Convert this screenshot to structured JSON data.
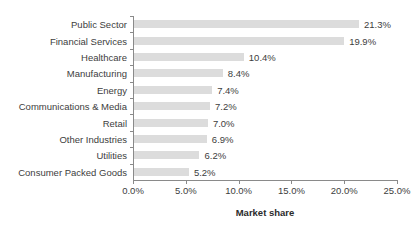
{
  "chart_data": {
    "type": "bar",
    "orientation": "horizontal",
    "title": "",
    "xlabel": "Market share",
    "ylabel": "",
    "xlim": [
      0,
      25
    ],
    "xticks": [
      "0.0%",
      "5.0%",
      "10.0%",
      "15.0%",
      "20.0%",
      "25.0%"
    ],
    "xtick_values": [
      0,
      5,
      10,
      15,
      20,
      25
    ],
    "grid": false,
    "legend": "none",
    "bar_color": "#dcdcdc",
    "categories": [
      "Public Sector",
      "Financial Services",
      "Healthcare",
      "Manufacturing",
      "Energy",
      "Communications & Media",
      "Retail",
      "Other Industries",
      "Utilities",
      "Consumer Packed Goods"
    ],
    "values": [
      21.3,
      19.9,
      10.4,
      8.4,
      7.4,
      7.2,
      7.0,
      6.9,
      6.2,
      5.2
    ],
    "data_labels": [
      "21.3%",
      "19.9%",
      "10.4%",
      "8.4%",
      "7.4%",
      "7.2%",
      "7.0%",
      "6.9%",
      "6.2%",
      "5.2%"
    ]
  }
}
